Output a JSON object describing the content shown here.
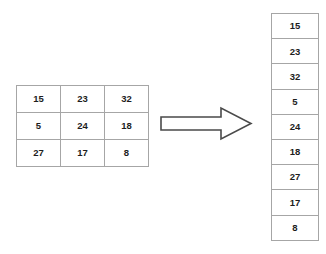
{
  "diagram": {
    "background_color": "#ffffff",
    "border_color": "#a6a6a6",
    "text_color": "#1d1d1d",
    "arrow": {
      "icon": "right-arrow-icon",
      "direction": "right",
      "style": "outlined-block-arrow",
      "stroke_color": "#4a4a4a",
      "fill_color": "#ffffff"
    },
    "matrix": {
      "rows": [
        [
          "15",
          "23",
          "32"
        ],
        [
          "5",
          "24",
          "18"
        ],
        [
          "27",
          "17",
          "8"
        ]
      ]
    },
    "flattened_list": {
      "values": [
        "15",
        "23",
        "32",
        "5",
        "24",
        "18",
        "27",
        "17",
        "8"
      ]
    }
  }
}
